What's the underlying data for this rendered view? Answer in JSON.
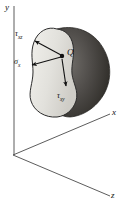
{
  "figure": {
    "background_color": "#ffffff",
    "line_color": "#3a3a3a",
    "ink_color": "#111111",
    "width": 128,
    "height": 208
  },
  "axes": {
    "origin": {
      "x": 13,
      "y": 155
    },
    "items": [
      {
        "name": "y-axis",
        "label": "y",
        "direction": "up",
        "tip": {
          "x": 14,
          "y": 6
        }
      },
      {
        "name": "x-axis",
        "label": "x",
        "direction": "up-right",
        "tip": {
          "x": 110,
          "y": 114
        }
      },
      {
        "name": "z-axis",
        "label": "z",
        "direction": "down-right",
        "tip": {
          "x": 110,
          "y": 196
        }
      }
    ]
  },
  "body": {
    "name": "sectioned-solid",
    "cut_face_fill": "#e3e2dd",
    "back_volume_fill": "#4a4846",
    "outline_color": "#2b2b2b",
    "cut_face_label": "cut section face",
    "back_label": "remaining body"
  },
  "point": {
    "label": "Q",
    "x": 62,
    "y": 56,
    "dot_radius": 2.2
  },
  "stresses": [
    {
      "name": "tau-xz",
      "symbol": "τ",
      "subscript": "xz",
      "label": "τxz",
      "arrow_from": {
        "x": 61,
        "y": 55
      },
      "arrow_to": {
        "x": 33,
        "y": 40
      },
      "description": "shear stress in z direction on x face"
    },
    {
      "name": "sigma-x",
      "symbol": "σ",
      "subscript": "x",
      "label": "σx",
      "arrow_from": {
        "x": 61,
        "y": 57
      },
      "arrow_to": {
        "x": 30,
        "y": 66
      },
      "description": "normal stress on x face"
    },
    {
      "name": "tau-xy",
      "symbol": "τ",
      "subscript": "xy",
      "label": "τxy",
      "arrow_from": {
        "x": 62,
        "y": 59
      },
      "arrow_to": {
        "x": 66,
        "y": 88
      },
      "description": "shear stress in y direction on x face"
    }
  ]
}
